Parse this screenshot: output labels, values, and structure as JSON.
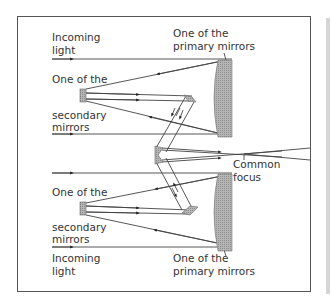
{
  "diagram": {
    "labels": {
      "incoming_light_top": [
        "Incoming",
        "light"
      ],
      "secondary_top": [
        "One of the",
        "secondary",
        "mirrors"
      ],
      "primary_top": [
        "One of the",
        "primary mirrors"
      ],
      "common_focus": [
        "Common",
        "focus"
      ],
      "secondary_bottom": [
        "One of the",
        "secondary",
        "mirrors"
      ],
      "incoming_light_bottom": [
        "Incoming",
        "light"
      ],
      "primary_bottom": [
        "One of the",
        "primary mirrors"
      ]
    },
    "colors": {
      "line": "#333333",
      "mirror_fill": "#a8a8a8",
      "frame": "#555555",
      "side_strip": "#d6d6d6"
    }
  }
}
